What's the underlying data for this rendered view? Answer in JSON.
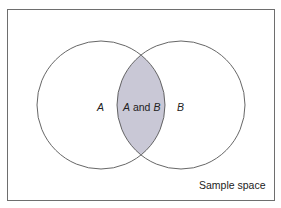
{
  "diagram": {
    "type": "venn",
    "frame_label": "Sample space",
    "sets": [
      {
        "name": "A",
        "label": "A",
        "cx": 101,
        "cy": 105,
        "r": 64
      },
      {
        "name": "B",
        "label": "B",
        "cx": 181,
        "cy": 105,
        "r": 64
      }
    ],
    "intersection": {
      "label_parts": [
        "A",
        " and ",
        "B"
      ],
      "fill": "#c9c8d6"
    },
    "colors": {
      "frame_stroke": "#6e6e6e",
      "circle_stroke": "#555555",
      "background": "#ffffff"
    }
  }
}
